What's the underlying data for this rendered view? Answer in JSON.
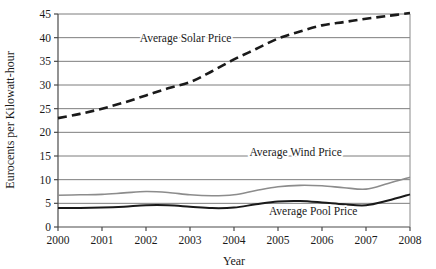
{
  "chart_data": {
    "type": "line",
    "title": "",
    "xlabel": "Year",
    "ylabel": "Eurocents per Kilowatt-hour",
    "xlim": [
      2000,
      2008
    ],
    "ylim": [
      0,
      45
    ],
    "xticks": [
      "2000",
      "2001",
      "2002",
      "2003",
      "2004",
      "2005",
      "2006",
      "2007",
      "2008"
    ],
    "yticks": [
      "0",
      "5",
      "10",
      "15",
      "20",
      "25",
      "30",
      "35",
      "40",
      "45"
    ],
    "grid": "horizontal",
    "legend_position": "inline-annotations",
    "x": [
      2000,
      2000.5,
      2001,
      2001.5,
      2002,
      2002.5,
      2003,
      2003.5,
      2004,
      2004.5,
      2005,
      2005.5,
      2006,
      2006.5,
      2007,
      2007.5,
      2008
    ],
    "series": [
      {
        "name": "Average Solar Price",
        "style": "dashed",
        "color": "#1a1a1a",
        "values": [
          23.0,
          23.9,
          25.0,
          26.3,
          27.8,
          29.3,
          30.6,
          32.9,
          35.4,
          37.6,
          39.8,
          41.3,
          42.6,
          43.3,
          44.0,
          44.6,
          45.2
        ]
      },
      {
        "name": "Average Wind Price",
        "style": "solid",
        "color": "#8c8c8c",
        "values": [
          6.7,
          6.8,
          6.9,
          7.2,
          7.5,
          7.3,
          6.8,
          6.6,
          6.8,
          7.7,
          8.5,
          8.8,
          8.7,
          8.3,
          8.0,
          9.2,
          10.5
        ]
      },
      {
        "name": "Average Pool Price",
        "style": "solid",
        "color": "#1a1a1a",
        "values": [
          4.0,
          4.0,
          4.1,
          4.3,
          4.6,
          4.6,
          4.3,
          4.0,
          4.1,
          4.8,
          5.4,
          5.5,
          5.2,
          4.8,
          4.6,
          5.6,
          6.9
        ]
      }
    ],
    "annotations": [
      {
        "text": "Average Solar Price",
        "x": 2002.9,
        "y": 39.0
      },
      {
        "text": "Average Wind Price",
        "x": 2005.4,
        "y": 15.0
      },
      {
        "text": "Average Pool Price",
        "x": 2005.8,
        "y": 2.6
      }
    ]
  }
}
